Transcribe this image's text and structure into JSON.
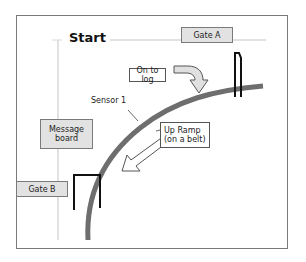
{
  "diagram": {
    "title": "Start",
    "labels": {
      "gate_a": "Gate A",
      "gate_b": "Gate B",
      "on_to_log": "On to log",
      "sensor_1": "Sensor 1",
      "message_board": "Message board",
      "up_ramp_line1": "Up Ramp",
      "up_ramp_line2": "(on a belt)"
    },
    "colors": {
      "frame": "#7a7a7a",
      "track": "#6e6e6e",
      "gate": "#111111",
      "gray_box": "#e2e2e2",
      "guide_line": "#d8d8d8"
    }
  }
}
